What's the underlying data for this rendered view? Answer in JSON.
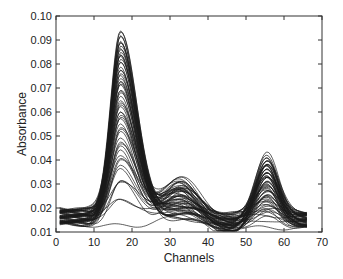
{
  "chart_data": {
    "type": "line",
    "title": "",
    "xlabel": "Channels",
    "ylabel": "Absorbance",
    "xlim": [
      0,
      70
    ],
    "ylim": [
      0.01,
      0.1
    ],
    "xticks": [
      0,
      10,
      20,
      30,
      40,
      50,
      60,
      70
    ],
    "yticks": [
      0.01,
      0.02,
      0.03,
      0.04,
      0.05,
      0.06,
      0.07,
      0.08,
      0.09,
      0.1
    ],
    "xtick_labels": [
      "0",
      "10",
      "20",
      "30",
      "40",
      "50",
      "60",
      "70"
    ],
    "ytick_labels": [
      "0.01",
      "0.02",
      "0.03",
      "0.04",
      "0.05",
      "0.06",
      "0.07",
      "0.08",
      "0.09",
      "0.10"
    ],
    "grid": false,
    "legend": null,
    "line_color": "#1a1a1a",
    "series_description": "Many overlaid absorbance spectra (approx. 60 curves) over channels 1-66",
    "features": {
      "peak1": {
        "center_channel": 17,
        "max_absorbance": 0.097,
        "min_peak_absorbance": 0.02
      },
      "peak2": {
        "center_channel": 32,
        "max_absorbance": 0.033,
        "min_peak_absorbance": 0.018
      },
      "peak3": {
        "center_channel": 55,
        "max_absorbance": 0.043,
        "min_peak_absorbance": 0.015
      },
      "baseline_start_range": [
        0.013,
        0.02
      ],
      "baseline_end_range": [
        0.012,
        0.018
      ]
    },
    "num_curves": 60,
    "channel_range": [
      1,
      66
    ]
  }
}
